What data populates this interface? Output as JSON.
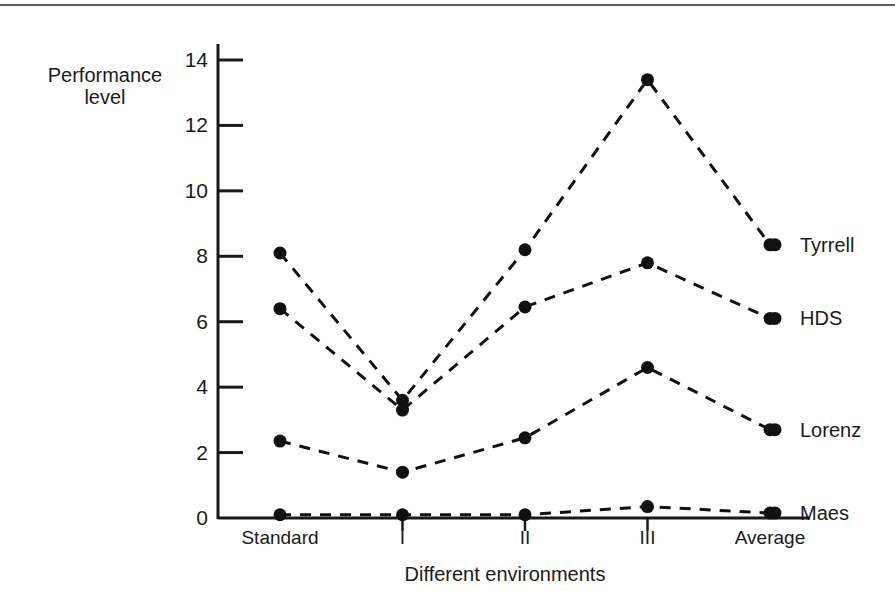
{
  "chart_data": {
    "type": "line",
    "title": "",
    "xlabel": "Different environments",
    "ylabel": "Performance level",
    "categories": [
      "Standard",
      "I",
      "II",
      "III",
      "Average"
    ],
    "ylim": [
      0,
      14
    ],
    "yticks": [
      0,
      2,
      4,
      6,
      8,
      10,
      12,
      14
    ],
    "ytick_labels": [
      "0",
      "2",
      "4",
      "6",
      "8",
      "10",
      "12",
      "14"
    ],
    "grid": false,
    "legend_position": "right-of-plot-inline",
    "line_style": "dashed",
    "marker": "filled-circle",
    "color": "#111111",
    "series": [
      {
        "name": "Tyrrell",
        "values": [
          8.1,
          3.6,
          8.2,
          13.4,
          8.35
        ]
      },
      {
        "name": "HDS",
        "values": [
          6.4,
          3.3,
          6.45,
          7.8,
          6.1
        ]
      },
      {
        "name": "Lorenz",
        "values": [
          2.35,
          1.4,
          2.45,
          4.6,
          2.7
        ]
      },
      {
        "name": "Maes",
        "values": [
          0.1,
          0.1,
          0.1,
          0.35,
          0.15
        ]
      }
    ]
  },
  "axes": {
    "y_title_line1": "Performance",
    "y_title_line2": "level",
    "x_title": "Different environments"
  },
  "tick_labels": {
    "y": [
      "14",
      "12",
      "10",
      "8",
      "6",
      "4",
      "2",
      "0"
    ]
  },
  "category_labels": [
    "Standard",
    "I",
    "II",
    "III",
    "Average"
  ],
  "series_labels": [
    "Tyrrell",
    "HDS",
    "Lorenz",
    "Maes"
  ]
}
